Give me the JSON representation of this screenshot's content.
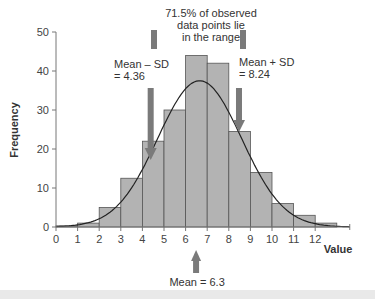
{
  "chart_data": {
    "type": "bar",
    "subtype": "histogram",
    "title": "",
    "xlabel": "Value",
    "ylabel": "Frequency",
    "xlim": [
      0,
      13.6
    ],
    "ylim": [
      0,
      50
    ],
    "x_ticks": [
      0,
      1,
      2,
      3,
      4,
      5,
      6,
      7,
      8,
      9,
      10,
      11,
      12
    ],
    "y_ticks": [
      0,
      10,
      20,
      30,
      40,
      50
    ],
    "bin_edges": [
      0,
      1,
      2,
      3,
      4,
      5,
      6,
      7,
      8,
      9,
      10,
      11,
      12,
      13
    ],
    "categories": [
      "0-1",
      "1-2",
      "2-3",
      "3-4",
      "4-5",
      "5-6",
      "6-7",
      "7-8",
      "8-9",
      "9-10",
      "10-11",
      "11-12",
      "12-13"
    ],
    "values": [
      0.3,
      1,
      5,
      12.5,
      22,
      30,
      44,
      42,
      24.5,
      14,
      6,
      3,
      1
    ],
    "bar_color": "#b3b3b3",
    "bar_edge_color": "#555555",
    "curve": {
      "type": "normal",
      "mean": 6.3,
      "sd": 1.94,
      "peak": 37.5,
      "color": "#222222"
    },
    "grid": false,
    "legend": null,
    "annotations": [
      {
        "id": "range",
        "text": [
          "71.5% of observed",
          "data points lie",
          "in the range"
        ]
      },
      {
        "id": "mean_minus_sd",
        "text": [
          "Mean – SD",
          "= 4.36"
        ],
        "x": 4.36
      },
      {
        "id": "mean_plus_sd",
        "text": [
          "Mean + SD",
          "= 8.24"
        ],
        "x": 8.24
      },
      {
        "id": "mean",
        "text": [
          "Mean = 6.3"
        ],
        "x": 6.3
      }
    ],
    "arrow_color": "#7a7a7a"
  }
}
